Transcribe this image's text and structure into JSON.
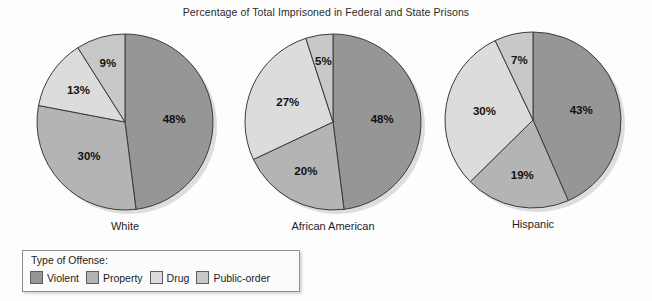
{
  "chart_data": {
    "type": "pie",
    "title": "Percentage of Total Imprisoned in Federal and State Prisons",
    "legend_title": "Type of Offense:",
    "legend_position": "bottom-left",
    "categories": [
      "Violent",
      "Property",
      "Drug",
      "Public-order"
    ],
    "colors": [
      "#969696",
      "#b4b4b4",
      "#dcdcdc",
      "#c8c8c8"
    ],
    "value_suffix": "%",
    "charts": [
      {
        "label": "White",
        "values": [
          48,
          30,
          13,
          9
        ],
        "value_labels": [
          "48%",
          "30%",
          "13%",
          "9%"
        ]
      },
      {
        "label": "African American",
        "values": [
          48,
          20,
          27,
          5
        ],
        "value_labels": [
          "48%",
          "20%",
          "27%",
          "5%"
        ]
      },
      {
        "label": "Hispanic",
        "values": [
          43,
          19,
          30,
          7
        ],
        "value_labels": [
          "43%",
          "19%",
          "30%",
          "7%"
        ]
      }
    ]
  },
  "pies": [
    {
      "label": "White",
      "cx": 125,
      "cy": 122,
      "r": 88,
      "values": [
        48,
        30,
        13,
        9
      ],
      "value_labels": [
        "48%",
        "30%",
        "13%",
        "9%"
      ]
    },
    {
      "label": "African American",
      "cx": 333,
      "cy": 122,
      "r": 88,
      "values": [
        48,
        20,
        27,
        5
      ],
      "value_labels": [
        "48%",
        "20%",
        "27%",
        "5%"
      ]
    },
    {
      "label": "Hispanic",
      "cx": 533,
      "cy": 120,
      "r": 88,
      "values": [
        43,
        19,
        30,
        7
      ],
      "value_labels": [
        "43%",
        "19%",
        "30%",
        "7%"
      ]
    }
  ],
  "legend": {
    "title": "Type of Offense:",
    "items": [
      {
        "label": "Violent",
        "color": "#969696"
      },
      {
        "label": "Property",
        "color": "#b4b4b4"
      },
      {
        "label": "Drug",
        "color": "#dcdcdc"
      },
      {
        "label": "Public-order",
        "color": "#c8c8c8"
      }
    ]
  }
}
